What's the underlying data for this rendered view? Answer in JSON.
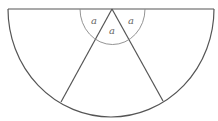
{
  "diagram": {
    "type": "semicircle-divided-into-sectors",
    "labels": {
      "left_angle": "a",
      "middle_angle": "a",
      "right_angle": "a"
    },
    "colors": {
      "stroke": "#555555",
      "small_arc": "#888888",
      "label": "#666666"
    }
  }
}
